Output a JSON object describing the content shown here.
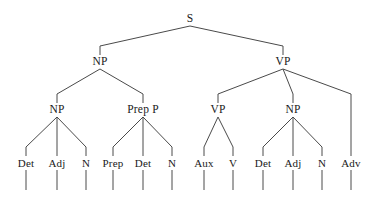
{
  "figure": {
    "kind": "syntax-tree",
    "background_color": "#ffffff",
    "line_color": "#4a4a4a",
    "text_color": "#1a1a1a",
    "width": 371,
    "height": 206
  },
  "levels": {
    "root_y": 19,
    "level2_y": 62,
    "level3_y": 110,
    "leaf_y": 163,
    "stem_bottom_y": 190
  },
  "nodes": {
    "root": {
      "label": "S",
      "x": 190,
      "y": 19
    },
    "level2": [
      {
        "label": "NP",
        "x": 100,
        "y": 62
      },
      {
        "label": "VP",
        "x": 283,
        "y": 62
      }
    ],
    "level3": [
      {
        "label": "NP",
        "x": 57,
        "y": 110
      },
      {
        "label": "Prep P",
        "x": 143,
        "y": 110
      },
      {
        "label": "VP",
        "x": 218,
        "y": 110
      },
      {
        "label": "NP",
        "x": 293,
        "y": 110
      }
    ],
    "leaves": [
      {
        "label": "Det",
        "x": 26,
        "y": 163
      },
      {
        "label": "Adj",
        "x": 57,
        "y": 163
      },
      {
        "label": "N",
        "x": 86,
        "y": 163
      },
      {
        "label": "Prep",
        "x": 113,
        "y": 163
      },
      {
        "label": "Det",
        "x": 143,
        "y": 163
      },
      {
        "label": "N",
        "x": 172,
        "y": 163
      },
      {
        "label": "Aux",
        "x": 204,
        "y": 163
      },
      {
        "label": "V",
        "x": 233,
        "y": 163
      },
      {
        "label": "Det",
        "x": 263,
        "y": 163
      },
      {
        "label": "Adj",
        "x": 293,
        "y": 163
      },
      {
        "label": "N",
        "x": 322,
        "y": 163
      },
      {
        "label": "Adv",
        "x": 351,
        "y": 163
      }
    ]
  },
  "chart_data": {
    "type": "diagram",
    "tree": {
      "label": "S",
      "children": [
        {
          "label": "NP",
          "children": [
            {
              "label": "NP",
              "children": [
                {
                  "label": "Det"
                },
                {
                  "label": "Adj"
                },
                {
                  "label": "N"
                }
              ]
            },
            {
              "label": "Prep P",
              "children": [
                {
                  "label": "Prep"
                },
                {
                  "label": "Det"
                },
                {
                  "label": "N"
                }
              ]
            }
          ]
        },
        {
          "label": "VP",
          "children": [
            {
              "label": "VP",
              "children": [
                {
                  "label": "Aux"
                },
                {
                  "label": "V"
                }
              ]
            },
            {
              "label": "NP",
              "children": [
                {
                  "label": "Det"
                },
                {
                  "label": "Adj"
                },
                {
                  "label": "N"
                }
              ]
            },
            {
              "label": "Adv"
            }
          ]
        }
      ]
    },
    "terminals": [
      "Det",
      "Adj",
      "N",
      "Prep",
      "Det",
      "N",
      "Aux",
      "V",
      "Det",
      "Adj",
      "N",
      "Adv"
    ]
  }
}
